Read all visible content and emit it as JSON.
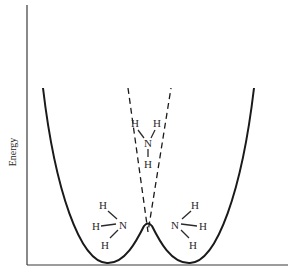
{
  "figure": {
    "type": "potential-energy-diagram",
    "y_axis_label": "Energy",
    "x_axis_label": "",
    "colors": {
      "line": "#1a1a1a",
      "axis": "#3a3a3a",
      "text": "#2a2a2a",
      "background": "#ffffff"
    }
  },
  "curves": [
    {
      "name": "double-well-potential",
      "style": "solid",
      "description": "Two wells with a small central barrier"
    },
    {
      "name": "planar-configuration-potential",
      "style": "dashed",
      "description": "Single parabola for planar NH3, crossing at barrier top"
    }
  ],
  "molecules": {
    "left": {
      "label": "pyramidal NH3 (left well)",
      "atoms": {
        "center": "N",
        "h_top": "H",
        "h_mid": "H",
        "h_bottom": "H"
      }
    },
    "center": {
      "label": "planar NH3 (transition state)",
      "atoms": {
        "center": "N",
        "h_left": "H",
        "h_right": "H",
        "h_bottom": "H"
      }
    },
    "right": {
      "label": "pyramidal NH3 (right well)",
      "atoms": {
        "center": "N",
        "h_top": "H",
        "h_mid": "H",
        "h_bottom": "H"
      }
    }
  }
}
